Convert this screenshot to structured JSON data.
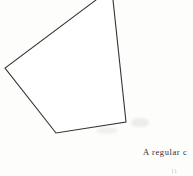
{
  "page": {
    "width": 193,
    "height": 176,
    "background_color": "#fdfdfc",
    "ink_color": "#333333",
    "smudge_color": "#dfdfdd"
  },
  "figure": {
    "name": "irregular-pentagon",
    "stroke_color": "#333333",
    "stroke_width": 1.1,
    "fill_color": "#ffffff",
    "vertices": [
      {
        "label": "top-apex-offscreen",
        "x": 104,
        "y": -22
      },
      {
        "label": "right-upper-edge-crop",
        "x": 113,
        "y": 0
      },
      {
        "label": "bottom-right",
        "x": 126,
        "y": 122
      },
      {
        "label": "bottom-left",
        "x": 56,
        "y": 133
      },
      {
        "label": "left",
        "x": 5,
        "y": 68
      },
      {
        "label": "left-upper-edge-crop",
        "x": 96,
        "y": 0
      }
    ],
    "path": "M 96 0 L 5 68 L 56 133 L 126 122 L 113 0"
  },
  "caption": {
    "primary": "A regular c",
    "secondary": "11",
    "truncated_right": true
  },
  "artifacts": [
    {
      "name": "smudge-near-bottom-right-vertex",
      "x": 131,
      "y": 118,
      "width": 18,
      "height": 9
    },
    {
      "name": "smudge-below-bottom-edge",
      "x": 96,
      "y": 127,
      "width": 22,
      "height": 7
    }
  ]
}
